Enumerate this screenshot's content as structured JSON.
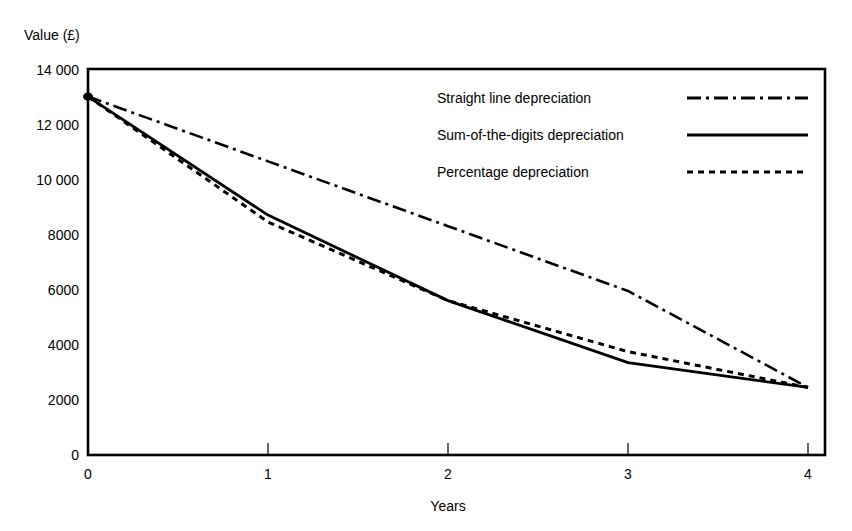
{
  "chart_data": {
    "type": "line",
    "title": "",
    "xlabel": "Years",
    "ylabel": "Value (£)",
    "x": [
      0,
      1,
      2,
      3,
      4
    ],
    "xtick_labels": [
      "0",
      "1",
      "2",
      "3",
      "4"
    ],
    "ytick_labels": [
      "0",
      "2000",
      "4000",
      "6000",
      "8000",
      "10 000",
      "12 000",
      "14 000"
    ],
    "ytick_values": [
      0,
      2000,
      4000,
      6000,
      8000,
      10000,
      12000,
      14000
    ],
    "xlim": [
      0,
      4
    ],
    "ylim": [
      0,
      14000
    ],
    "grid": false,
    "legend_position": "upper-right-inside",
    "series": [
      {
        "name": "Straight line depreciation",
        "style": "dash-dot",
        "color": "#000000",
        "values": [
          13000,
          10650,
          8300,
          5950,
          2450
        ]
      },
      {
        "name": "Sum-of-the-digits depreciation",
        "style": "solid",
        "color": "#000000",
        "values": [
          13000,
          8700,
          5600,
          3350,
          2450
        ]
      },
      {
        "name": "Percentage depreciation",
        "style": "dotted",
        "color": "#000000",
        "values": [
          13000,
          8450,
          5600,
          3750,
          2450
        ]
      }
    ]
  },
  "axes": {
    "y_axis_title": "Value (£)",
    "x_axis_title": "Years",
    "y_ticks": [
      {
        "label": "14 000",
        "value": 14000
      },
      {
        "label": "12 000",
        "value": 12000
      },
      {
        "label": "10 000",
        "value": 10000
      },
      {
        "label": "8000",
        "value": 8000
      },
      {
        "label": "6000",
        "value": 6000
      },
      {
        "label": "4000",
        "value": 4000
      },
      {
        "label": "2000",
        "value": 2000
      },
      {
        "label": "0",
        "value": 0
      }
    ],
    "x_ticks": [
      {
        "label": "0",
        "value": 0
      },
      {
        "label": "1",
        "value": 1
      },
      {
        "label": "2",
        "value": 2
      },
      {
        "label": "3",
        "value": 3
      },
      {
        "label": "4",
        "value": 4
      }
    ]
  },
  "legend": {
    "entries": [
      {
        "label": "Straight line depreciation",
        "style": "dash-dot"
      },
      {
        "label": "Sum-of-the-digits depreciation",
        "style": "solid"
      },
      {
        "label": "Percentage depreciation",
        "style": "dotted"
      }
    ]
  }
}
